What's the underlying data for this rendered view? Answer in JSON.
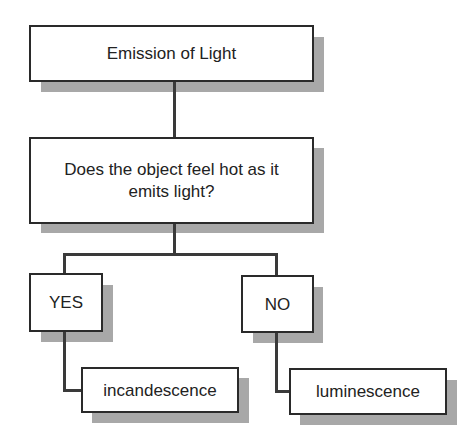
{
  "diagram": {
    "type": "flowchart",
    "colors": {
      "border": "#2a2a2a",
      "shadow": "#a8a8a8",
      "connector": "#3a3a3a",
      "text": "#222222",
      "background": "#ffffff"
    },
    "nodes": {
      "root": {
        "label": "Emission of Light"
      },
      "question": {
        "label": "Does the object feel hot as it emits light?"
      },
      "yes": {
        "label": "YES"
      },
      "no": {
        "label": "NO"
      },
      "yes_result": {
        "label": "incandescence"
      },
      "no_result": {
        "label": "luminescence"
      }
    },
    "edges": [
      {
        "from": "root",
        "to": "question"
      },
      {
        "from": "question",
        "to": "yes"
      },
      {
        "from": "question",
        "to": "no"
      },
      {
        "from": "yes",
        "to": "yes_result"
      },
      {
        "from": "no",
        "to": "no_result"
      }
    ]
  }
}
